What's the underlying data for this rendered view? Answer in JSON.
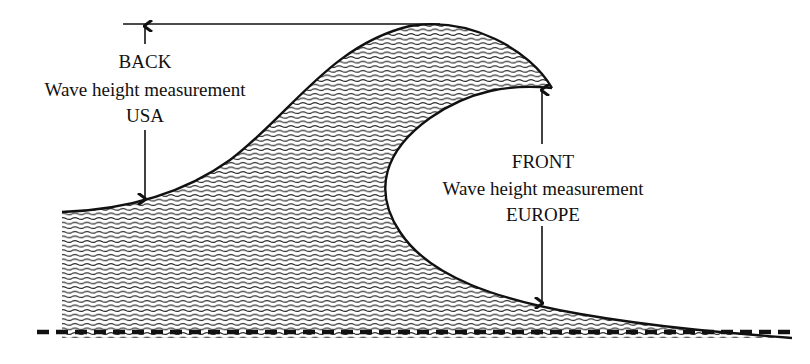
{
  "diagram": {
    "colors": {
      "ink": "#111111",
      "background": "#ffffff",
      "water_hatch": "#222222"
    },
    "back_label": {
      "line1": "BACK",
      "line2": "Wave height measurement",
      "line3": "USA"
    },
    "front_label": {
      "line1": "FRONT",
      "line2": "Wave height measurement",
      "line3": "EUROPE"
    },
    "icons": {
      "back_arrow": "double-headed-vertical-arrow",
      "front_arrow": "double-headed-vertical-arrow"
    }
  }
}
